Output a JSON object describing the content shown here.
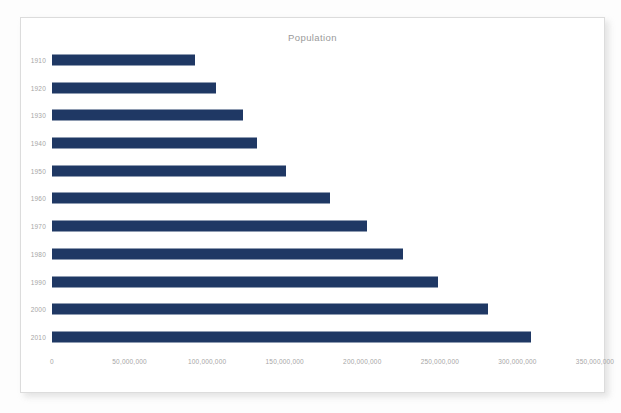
{
  "chart_data": {
    "type": "bar",
    "orientation": "horizontal",
    "title": "Population",
    "xlabel": "",
    "ylabel": "",
    "categories": [
      "1910",
      "1920",
      "1930",
      "1940",
      "1950",
      "1960",
      "1970",
      "1980",
      "1990",
      "2000",
      "2010"
    ],
    "values": [
      92000000,
      106000000,
      123000000,
      132000000,
      151000000,
      179000000,
      203000000,
      226000000,
      249000000,
      281000000,
      309000000
    ],
    "xlim": [
      0,
      350000000
    ],
    "xticks": [
      0,
      50000000,
      100000000,
      150000000,
      200000000,
      250000000,
      300000000,
      350000000
    ],
    "xtick_labels": [
      "0",
      "50,000,000",
      "100,000,000",
      "150,000,000",
      "200,000,000",
      "250,000,000",
      "300,000,000",
      "350,000,000"
    ],
    "grid": false,
    "legend": null,
    "series": [
      {
        "name": "Population",
        "color": "#1F3864",
        "values": [
          92000000,
          106000000,
          123000000,
          132000000,
          151000000,
          179000000,
          203000000,
          226000000,
          249000000,
          281000000,
          309000000
        ]
      }
    ]
  },
  "colors": {
    "bar": "#1F3864",
    "tick_text": "#A6A6A6",
    "title_text": "#9A9A9A",
    "frame_border": "#DCDCDC",
    "background": "#FFFFFF"
  }
}
